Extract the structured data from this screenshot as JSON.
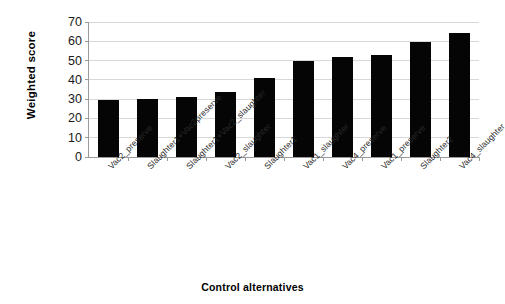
{
  "chart_data": {
    "type": "bar",
    "title": "",
    "xlabel": "Control alternatives",
    "ylabel": "Weighted score",
    "ylim": [
      0,
      70
    ],
    "yticks": [
      0,
      10,
      20,
      30,
      40,
      50,
      60,
      70
    ],
    "grid": true,
    "legend": "none",
    "bar_color": "#050505",
    "categories": [
      "Vac2_preserve",
      "Slaughter1+Vac2preserve",
      "Slaughter1+Vac2_slaughter",
      "Vac2_slaughter",
      "Slaughter1",
      "Vac1_slaughter",
      "Vac4_preserve",
      "Vac1_preserve",
      "Slaughter2",
      "Vac4_slaughter"
    ],
    "values": [
      29.5,
      30,
      31,
      33.5,
      41,
      50,
      52,
      53,
      59.5,
      64.5
    ]
  }
}
